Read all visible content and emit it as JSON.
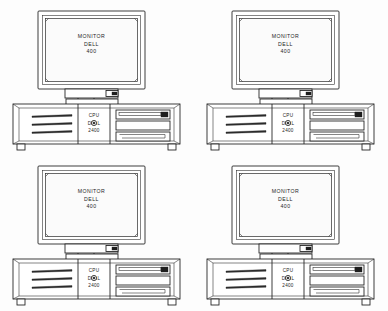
{
  "page": {
    "background_color": "#fdfdfd",
    "ink_color": "#1b1b1b",
    "grid": "2x2"
  },
  "labels": {
    "monitor_line1": "MONITOR",
    "monitor_line2": "DELL",
    "monitor_line3": "400",
    "cpu_line1": "CPU",
    "cpu_line2": "DELL",
    "cpu_line3": "2400"
  },
  "units": [
    {
      "id": "unit-top-left",
      "position": "top-left",
      "monitor": {
        "line1": "MONITOR",
        "line2": "DELL",
        "line3": "400"
      },
      "cpu": {
        "line1": "CPU",
        "line2": "DELL",
        "line3": "2400"
      }
    },
    {
      "id": "unit-top-right",
      "position": "top-right",
      "monitor": {
        "line1": "MONITOR",
        "line2": "DELL",
        "line3": "400"
      },
      "cpu": {
        "line1": "CPU",
        "line2": "DELL",
        "line3": "2400"
      }
    },
    {
      "id": "unit-bottom-left",
      "position": "bottom-left",
      "monitor": {
        "line1": "MONITOR",
        "line2": "DELL",
        "line3": "400"
      },
      "cpu": {
        "line1": "CPU",
        "line2": "DELL",
        "line3": "2400"
      }
    },
    {
      "id": "unit-bottom-right",
      "position": "bottom-right",
      "monitor": {
        "line1": "MONITOR",
        "line2": "DELL",
        "line3": "400"
      },
      "cpu": {
        "line1": "CPU",
        "line2": "DELL",
        "line3": "2400"
      }
    }
  ],
  "parts": {
    "monitor_bezel": "monitor-bezel",
    "monitor_screen": "monitor-screen",
    "monitor_control_panel": "monitor-control-panel",
    "monitor_power_button": "monitor-power-button",
    "monitor_neck": "monitor-neck",
    "monitor_base": "monitor-base",
    "cpu_case": "cpu-case",
    "cpu_vents": "cpu-vent-slots",
    "cpu_drive_bays": "cpu-drive-bays",
    "cpu_power_button": "cpu-power-button",
    "cpu_feet": "cpu-feet"
  }
}
